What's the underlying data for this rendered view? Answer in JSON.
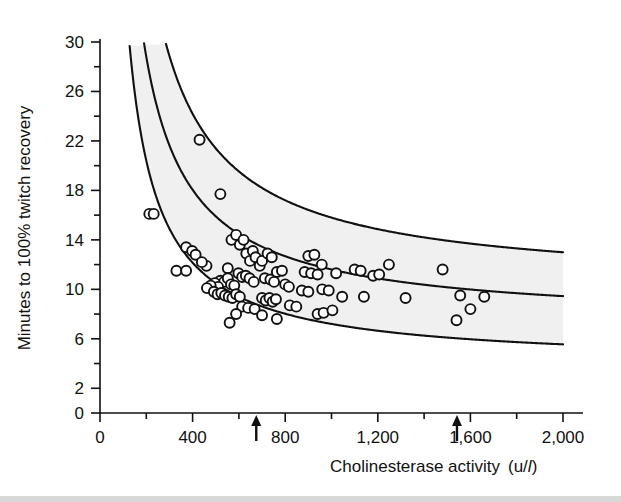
{
  "figure": {
    "background": "#ffffff",
    "ink": "#111111",
    "band_fill": "#f0f0f0",
    "marker_face": "#ffffff",
    "marker_edge": "#111111",
    "width": 621,
    "height": 502
  },
  "axes": {
    "x": {
      "label_main": "Cholinesterase activity",
      "label_unit_open": "(u/",
      "label_unit_italic": "l",
      "label_unit_close": ")",
      "ticks": [
        0,
        400,
        800,
        1200,
        1600,
        2000
      ],
      "tick_labels": [
        "0",
        "400",
        "800",
        "1,200",
        "1,600",
        "2,000"
      ],
      "minor_step": 200,
      "range": [
        0,
        2000
      ],
      "pixel_range": [
        100,
        563
      ]
    },
    "y": {
      "label": "Minutes to 100% twitch recovery",
      "ticks": [
        0,
        2,
        6,
        10,
        14,
        18,
        22,
        26,
        30
      ],
      "tick_labels": [
        "0",
        "2",
        "6",
        "10",
        "14",
        "18",
        "22",
        "26",
        "30"
      ],
      "minor_step": 2,
      "range": [
        0,
        30
      ],
      "pixel_range": [
        413,
        42
      ]
    }
  },
  "annotations": {
    "arrows": [
      {
        "name": "arrow-marker-low",
        "x_value": 675,
        "direction": "up"
      },
      {
        "name": "arrow-marker-high",
        "x_value": 1542,
        "direction": "up"
      }
    ]
  },
  "chart_data": {
    "type": "scatter",
    "title": "",
    "xlabel": "Cholinesterase activity (u/l)",
    "ylabel": "Minutes to 100% twitch recovery",
    "xlim": [
      0,
      2000
    ],
    "ylim": [
      0,
      30
    ],
    "grid": false,
    "legend": "none",
    "curves": [
      {
        "name": "upper-confidence-curve",
        "description": "upper boundary of shaded band, hyperbolic decay",
        "model": "y = a/x + c",
        "a": 5600,
        "c": 10.2,
        "x_start": 190,
        "x_end": 2000
      },
      {
        "name": "central-regression-curve",
        "description": "central fitted curve through the scatter",
        "model": "y = a/x + c",
        "a": 4300,
        "c": 7.3,
        "x_start": 158,
        "x_end": 2000
      },
      {
        "name": "lower-confidence-curve",
        "description": "lower boundary of shaded band, hyperbolic decay",
        "model": "y = a/x + c",
        "a": 3300,
        "c": 3.9,
        "x_start": 128,
        "x_end": 2000
      }
    ],
    "points": [
      [
        430,
        22.1
      ],
      [
        213,
        16.1
      ],
      [
        232,
        16.1
      ],
      [
        520,
        17.7
      ],
      [
        372,
        13.4
      ],
      [
        398,
        13.1
      ],
      [
        413,
        12.8
      ],
      [
        330,
        11.5
      ],
      [
        372,
        11.5
      ],
      [
        552,
        11.7
      ],
      [
        568,
        14.0
      ],
      [
        588,
        14.4
      ],
      [
        604,
        13.6
      ],
      [
        620,
        14.0
      ],
      [
        632,
        12.9
      ],
      [
        648,
        12.3
      ],
      [
        660,
        13.1
      ],
      [
        672,
        12.6
      ],
      [
        690,
        11.9
      ],
      [
        598,
        11.3
      ],
      [
        614,
        11.0
      ],
      [
        630,
        11.1
      ],
      [
        646,
        10.9
      ],
      [
        664,
        10.6
      ],
      [
        520,
        10.7
      ],
      [
        536,
        10.6
      ],
      [
        552,
        10.9
      ],
      [
        566,
        10.4
      ],
      [
        580,
        10.3
      ],
      [
        496,
        10.5
      ],
      [
        510,
        10.2
      ],
      [
        478,
        10.3
      ],
      [
        462,
        10.1
      ],
      [
        492,
        9.8
      ],
      [
        508,
        9.6
      ],
      [
        524,
        9.7
      ],
      [
        540,
        9.5
      ],
      [
        556,
        9.4
      ],
      [
        572,
        9.3
      ],
      [
        588,
        9.6
      ],
      [
        604,
        9.4
      ],
      [
        700,
        12.3
      ],
      [
        724,
        12.9
      ],
      [
        742,
        12.6
      ],
      [
        712,
        10.9
      ],
      [
        736,
        10.8
      ],
      [
        752,
        10.6
      ],
      [
        764,
        11.4
      ],
      [
        786,
        11.5
      ],
      [
        800,
        10.4
      ],
      [
        816,
        10.2
      ],
      [
        700,
        9.3
      ],
      [
        716,
        9.1
      ],
      [
        732,
        9.3
      ],
      [
        746,
        9.0
      ],
      [
        760,
        9.2
      ],
      [
        614,
        8.6
      ],
      [
        640,
        8.5
      ],
      [
        668,
        8.4
      ],
      [
        588,
        8.0
      ],
      [
        700,
        7.9
      ],
      [
        560,
        7.3
      ],
      [
        900,
        12.7
      ],
      [
        926,
        12.8
      ],
      [
        884,
        11.4
      ],
      [
        912,
        11.3
      ],
      [
        940,
        11.2
      ],
      [
        958,
        12.0
      ],
      [
        872,
        9.9
      ],
      [
        900,
        9.8
      ],
      [
        960,
        10.0
      ],
      [
        988,
        9.9
      ],
      [
        1020,
        11.3
      ],
      [
        1100,
        11.6
      ],
      [
        1126,
        11.5
      ],
      [
        1180,
        11.1
      ],
      [
        1206,
        11.2
      ],
      [
        1248,
        12.0
      ],
      [
        1140,
        9.4
      ],
      [
        1320,
        9.3
      ],
      [
        1480,
        11.6
      ],
      [
        1556,
        9.5
      ],
      [
        1600,
        8.4
      ],
      [
        1660,
        9.4
      ],
      [
        1540,
        7.5
      ],
      [
        1046,
        9.4
      ],
      [
        820,
        8.7
      ],
      [
        848,
        8.6
      ],
      [
        940,
        8.0
      ],
      [
        966,
        8.1
      ],
      [
        1004,
        8.3
      ],
      [
        764,
        7.6
      ],
      [
        460,
        11.9
      ],
      [
        440,
        12.2
      ]
    ],
    "n_points": 96
  }
}
